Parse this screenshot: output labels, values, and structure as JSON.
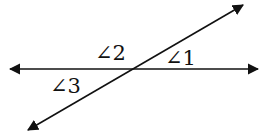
{
  "diagram": {
    "type": "intersecting-lines",
    "lines": [
      {
        "name": "horizontal-line",
        "x1": 10,
        "y1": 69,
        "x2": 258,
        "y2": 69,
        "arrows": "both"
      },
      {
        "name": "transversal-line",
        "x1": 28,
        "y1": 130,
        "x2": 243,
        "y2": 5,
        "arrows": "both"
      }
    ],
    "intersection": {
      "x": 133,
      "y": 69
    },
    "labels": [
      {
        "id": "angle-1",
        "text": "∠1",
        "x": 165,
        "y": 65
      },
      {
        "id": "angle-2",
        "text": "∠2",
        "x": 95,
        "y": 60
      },
      {
        "id": "angle-3",
        "text": "∠3",
        "x": 50,
        "y": 93
      }
    ],
    "stroke_color": "#111111"
  }
}
